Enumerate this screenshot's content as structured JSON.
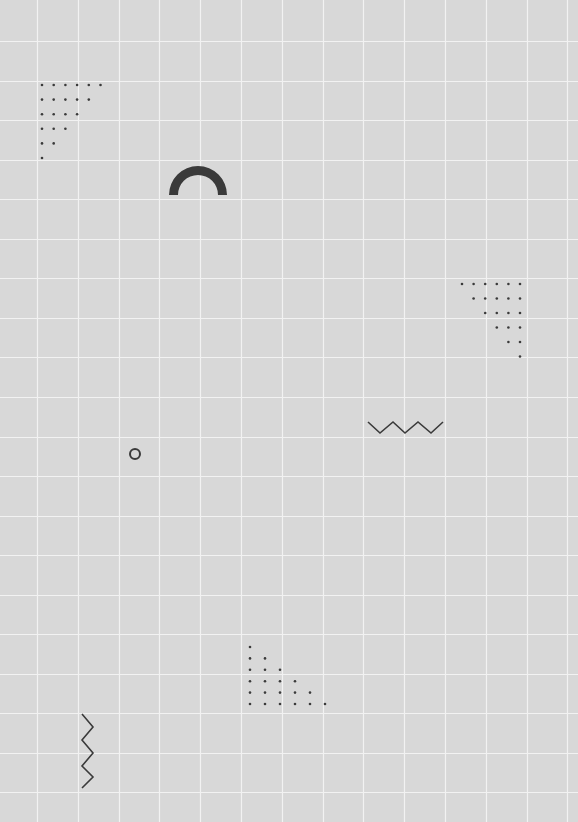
{
  "canvas": {
    "width": 578,
    "height": 822,
    "background": "#d8d8d8",
    "grid_color": "#f2f2f2",
    "grid_x_start": 37,
    "grid_x_step": 40.8,
    "grid_y_start": 41,
    "grid_y_step": 39.55,
    "shape_color": "#3a3a3a"
  },
  "shapes": {
    "dot_triangle_top_left": {
      "origin": [
        42,
        85
      ],
      "dx": 11.7,
      "dy": 14.6,
      "rows": [
        6,
        5,
        4,
        3,
        2,
        1
      ],
      "align": "left"
    },
    "half_ring": {
      "cx": 198,
      "cy": 195,
      "outer_r": 29,
      "inner_r": 20
    },
    "dot_triangle_right": {
      "origin": [
        462,
        284
      ],
      "dx": 11.6,
      "dy": 14.5,
      "rows": [
        6,
        5,
        4,
        3,
        2,
        1
      ],
      "align": "right"
    },
    "zigzag_horizontal": {
      "points": [
        [
          368,
          422
        ],
        [
          380,
          433
        ],
        [
          393,
          422
        ],
        [
          405,
          433
        ],
        [
          418,
          422
        ],
        [
          431,
          433
        ],
        [
          443,
          422
        ]
      ]
    },
    "small_circle": {
      "cx": 135,
      "cy": 454,
      "r": 5
    },
    "dot_triangle_bottom": {
      "origin": [
        250,
        647
      ],
      "dx": 15,
      "dy": 11.4,
      "rows": [
        1,
        2,
        3,
        4,
        5,
        6
      ],
      "align": "left"
    },
    "zigzag_vertical": {
      "points": [
        [
          82,
          714
        ],
        [
          93,
          727
        ],
        [
          82,
          740
        ],
        [
          93,
          753
        ],
        [
          82,
          766
        ],
        [
          93,
          777
        ],
        [
          82,
          788
        ]
      ]
    }
  }
}
